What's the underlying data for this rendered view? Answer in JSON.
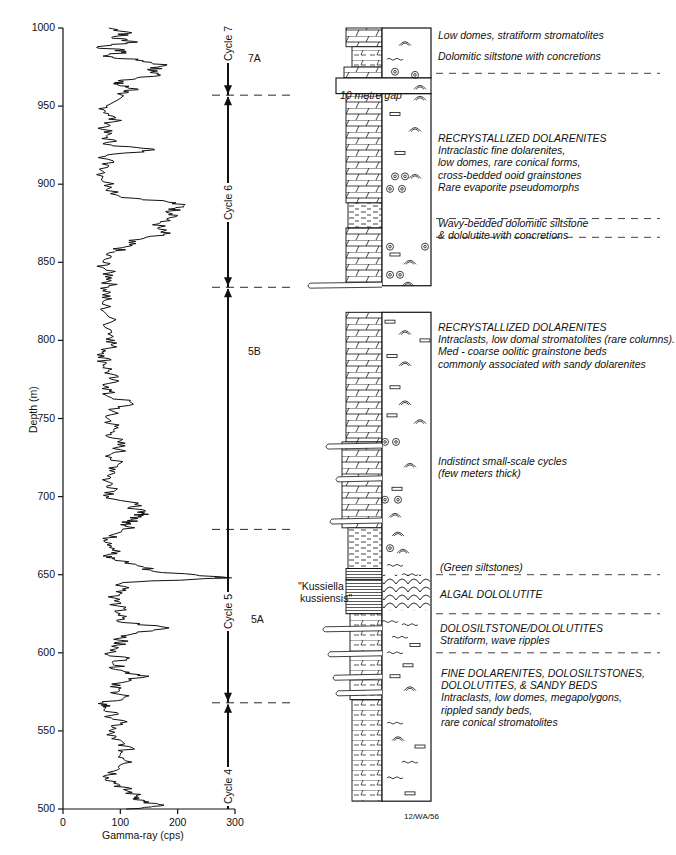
{
  "chart_data": {
    "type": "line",
    "title": "",
    "xlabel": "Gamma-ray (cps)",
    "ylabel": "Depth (m)",
    "xlim": [
      0,
      300
    ],
    "ylim": [
      500,
      1000
    ],
    "y_inverted": false,
    "x_ticks": [
      0,
      100,
      200,
      300
    ],
    "y_ticks": [
      500,
      550,
      600,
      650,
      700,
      750,
      800,
      850,
      900,
      950,
      1000
    ],
    "grid": false,
    "legend": null,
    "series": [
      {
        "name": "Gamma-ray log",
        "points_depth_cps": [
          [
            1000,
            80
          ],
          [
            997,
            120
          ],
          [
            994,
            85
          ],
          [
            991,
            130
          ],
          [
            988,
            60
          ],
          [
            985,
            110
          ],
          [
            982,
            70
          ],
          [
            979,
            140
          ],
          [
            976,
            180
          ],
          [
            973,
            150
          ],
          [
            970,
            170
          ],
          [
            967,
            120
          ],
          [
            965,
            90
          ],
          [
            963,
            100
          ],
          [
            961,
            130
          ],
          [
            958,
            95
          ],
          [
            950,
            75
          ],
          [
            945,
            80
          ],
          [
            940,
            90
          ],
          [
            935,
            70
          ],
          [
            930,
            78
          ],
          [
            925,
            85
          ],
          [
            922,
            160
          ],
          [
            918,
            75
          ],
          [
            912,
            80
          ],
          [
            905,
            70
          ],
          [
            898,
            85
          ],
          [
            892,
            100
          ],
          [
            889,
            180
          ],
          [
            886,
            210
          ],
          [
            883,
            190
          ],
          [
            880,
            200
          ],
          [
            876,
            170
          ],
          [
            872,
            165
          ],
          [
            868,
            175
          ],
          [
            864,
            115
          ],
          [
            860,
            110
          ],
          [
            856,
            80
          ],
          [
            850,
            70
          ],
          [
            845,
            75
          ],
          [
            840,
            85
          ],
          [
            835,
            80
          ],
          [
            830,
            78
          ],
          [
            825,
            70
          ],
          [
            815,
            80
          ],
          [
            805,
            85
          ],
          [
            800,
            90
          ],
          [
            795,
            80
          ],
          [
            790,
            72
          ],
          [
            785,
            75
          ],
          [
            780,
            80
          ],
          [
            775,
            85
          ],
          [
            770,
            80
          ],
          [
            765,
            75
          ],
          [
            760,
            120
          ],
          [
            755,
            85
          ],
          [
            750,
            78
          ],
          [
            745,
            90
          ],
          [
            740,
            85
          ],
          [
            735,
            95
          ],
          [
            730,
            100
          ],
          [
            725,
            85
          ],
          [
            720,
            95
          ],
          [
            715,
            90
          ],
          [
            710,
            75
          ],
          [
            705,
            95
          ],
          [
            700,
            80
          ],
          [
            695,
            125
          ],
          [
            690,
            130
          ],
          [
            688,
            140
          ],
          [
            685,
            120
          ],
          [
            683,
            110
          ],
          [
            680,
            125
          ],
          [
            675,
            80
          ],
          [
            670,
            85
          ],
          [
            665,
            100
          ],
          [
            662,
            70
          ],
          [
            660,
            90
          ],
          [
            655,
            140
          ],
          [
            652,
            160
          ],
          [
            648,
            290
          ],
          [
            645,
            105
          ],
          [
            640,
            110
          ],
          [
            635,
            90
          ],
          [
            630,
            95
          ],
          [
            625,
            100
          ],
          [
            620,
            95
          ],
          [
            616,
            185
          ],
          [
            612,
            120
          ],
          [
            608,
            100
          ],
          [
            605,
            95
          ],
          [
            600,
            80
          ],
          [
            596,
            110
          ],
          [
            592,
            90
          ],
          [
            588,
            105
          ],
          [
            585,
            150
          ],
          [
            580,
            85
          ],
          [
            575,
            95
          ],
          [
            572,
            110
          ],
          [
            568,
            70
          ],
          [
            565,
            75
          ],
          [
            560,
            85
          ],
          [
            555,
            100
          ],
          [
            550,
            80
          ],
          [
            545,
            85
          ],
          [
            540,
            115
          ],
          [
            535,
            100
          ],
          [
            530,
            120
          ],
          [
            525,
            95
          ],
          [
            520,
            80
          ],
          [
            515,
            100
          ],
          [
            512,
            110
          ],
          [
            508,
            130
          ],
          [
            505,
            140
          ],
          [
            502,
            170
          ],
          [
            500,
            110
          ]
        ]
      }
    ],
    "cycles": [
      {
        "label": "Cycle 4",
        "top_m": 568,
        "base_m": 500
      },
      {
        "label": "Cycle 5",
        "top_m": 834,
        "base_m": 568
      },
      {
        "label": "Cycle 6",
        "top_m": 957,
        "base_m": 834
      },
      {
        "label": "Cycle 7",
        "top_m": 1000,
        "base_m": 957
      }
    ],
    "subunits": [
      {
        "label": "7A",
        "depth_m": 985
      },
      {
        "label": "5B",
        "depth_m": 760
      },
      {
        "label": "5A",
        "depth_m": 620
      }
    ],
    "annotations": [
      {
        "text": "\"Kussiella kussiensis\"",
        "depth_m": 640
      },
      {
        "text": "10 metre gap",
        "depth_m": 962
      },
      {
        "text": "12/WA/56",
        "position": "below-lithology-column"
      }
    ]
  },
  "axes": {
    "ylabel": "Depth (m)",
    "xlabel": "Gamma-ray (cps)",
    "y_tick_labels": [
      "500",
      "550",
      "600",
      "650",
      "700",
      "750",
      "800",
      "850",
      "900",
      "950",
      "1000"
    ],
    "x_tick_labels": [
      "0",
      "100",
      "200",
      "300"
    ]
  },
  "cycles": {
    "c7": "Cycle 7",
    "c6": "Cycle 6",
    "c5": "Cycle 5",
    "c4": "Cycle 4",
    "s7a": "7A",
    "s5b": "5B",
    "s5a": "5A"
  },
  "column": {
    "gap_label": "10 metre gap",
    "fossil_label_1": "\"Kussiella",
    "fossil_label_2": "kussiensis\"",
    "figure_id": "12/WA/56"
  },
  "descriptions": [
    {
      "lines": [
        "Low domes, stratiform stromatolites"
      ]
    },
    {
      "lines": [
        "Dolomitic siltstone with concretions"
      ]
    },
    {
      "lines": [
        "RECRYSTALLIZED DOLARENITES",
        "Intraclastic fine dolarenites,",
        "low domes, rare conical forms,",
        "cross-bedded ooid grainstones",
        "Rare evaporite pseudomorphs"
      ]
    },
    {
      "lines": [
        "Wavy-bedded dolomitic siltstone",
        "& dololutite with concretions"
      ]
    },
    {
      "lines": [
        "RECRYSTALLIZED DOLARENITES",
        "Intraclasts,  low domal stromatolites (rare columns).",
        "Med - coarse oolitic grainstone beds",
        "commonly associated with sandy dolarenites"
      ]
    },
    {
      "lines": [
        "Indistinct small-scale cycles",
        "(few meters thick)"
      ]
    },
    {
      "lines": [
        "(Green siltstones)"
      ]
    },
    {
      "lines": [
        "ALGAL DOLOLUTITE"
      ]
    },
    {
      "lines": [
        "DOLOSILTSTONE/DOLOLUTITES",
        "Stratiform, wave ripples"
      ]
    },
    {
      "lines": [
        "FINE DOLARENITES, DOLOSILTSTONES,",
        "DOLOLUTITES, & SANDY BEDS",
        "Intraclasts, low domes, megapolygons,",
        "rippled sandy beds,",
        "rare conical stromatolites"
      ]
    }
  ]
}
